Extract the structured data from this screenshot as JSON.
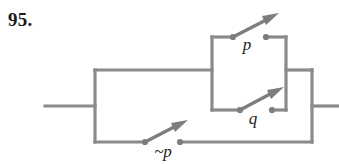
{
  "exercise": {
    "number": "95."
  },
  "figure": {
    "type": "switching-circuit",
    "colors": {
      "wire": "#8a8a8a",
      "wire_dark": "#6f6f6f",
      "label": "#1c1c1c",
      "number": "#1a1a1a",
      "background": "#ffffff"
    },
    "switches": [
      {
        "id": "p",
        "label": "p",
        "state": "open",
        "position": "inner-top",
        "label_x": 247,
        "label_y": 50
      },
      {
        "id": "q",
        "label": "q",
        "state": "open",
        "position": "inner-bottom",
        "label_x": 253,
        "label_y": 124
      },
      {
        "id": "np",
        "label": "~p",
        "state": "open",
        "position": "outer-bottom",
        "label_x": 163,
        "label_y": 157
      }
    ],
    "terminals": [
      {
        "id": "input",
        "side": "left",
        "x": 45,
        "y": 106
      },
      {
        "id": "output",
        "side": "right",
        "x": 339,
        "y": 106
      }
    ]
  }
}
